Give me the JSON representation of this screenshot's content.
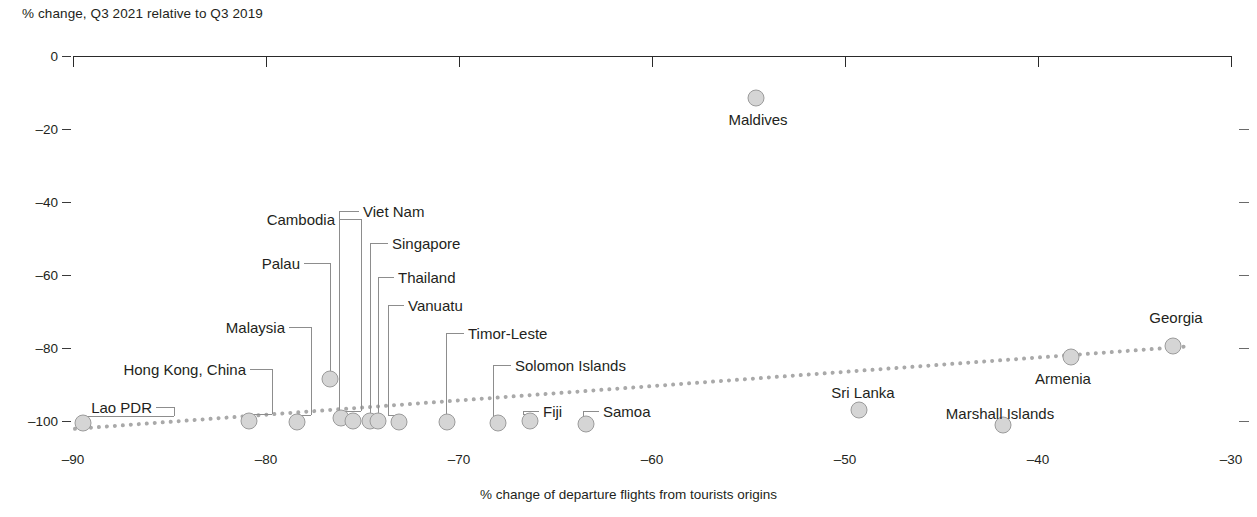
{
  "chart_data": {
    "type": "scatter",
    "title": "",
    "ylabel": "% change, Q3 2021 relative to Q3 2019",
    "xlabel": "% change of departure flights from tourists origins",
    "xlim": [
      -90,
      -30
    ],
    "ylim": [
      -105,
      0
    ],
    "xticks": [
      -90,
      -80,
      -70,
      -60,
      -50,
      -40,
      -30
    ],
    "xtick_labels": [
      "–90",
      "–80",
      "–70",
      "–60",
      "–50",
      "–40",
      "–30"
    ],
    "yticks": [
      0,
      -20,
      -40,
      -60,
      -80,
      -100
    ],
    "ytick_labels": [
      "0",
      "–20",
      "–40",
      "–60",
      "–80",
      "–100"
    ],
    "grid": false,
    "legend": "none",
    "points": [
      {
        "name": "Lao PDR",
        "x": -89.5,
        "y": -100.6
      },
      {
        "name": "Hong Kong, China",
        "x": -80.9,
        "y": -100.0
      },
      {
        "name": "Malaysia",
        "x": -78.4,
        "y": -100.3
      },
      {
        "name": "Palau",
        "x": -76.7,
        "y": -88.5
      },
      {
        "name": "Cambodia",
        "x": -76.1,
        "y": -99.2
      },
      {
        "name": "Viet Nam",
        "x": -75.5,
        "y": -99.9
      },
      {
        "name": "Singapore",
        "x": -74.6,
        "y": -100.1
      },
      {
        "name": "Thailand",
        "x": -74.2,
        "y": -100.1
      },
      {
        "name": "Vanuatu",
        "x": -73.1,
        "y": -100.3
      },
      {
        "name": "Timor-Leste",
        "x": -70.6,
        "y": -100.3
      },
      {
        "name": "Solomon Islands",
        "x": -68.0,
        "y": -100.5
      },
      {
        "name": "Fiji",
        "x": -66.3,
        "y": -100.0
      },
      {
        "name": "Samoa",
        "x": -63.4,
        "y": -100.7
      },
      {
        "name": "Maldives",
        "x": -54.6,
        "y": -11.5
      },
      {
        "name": "Sri Lanka",
        "x": -49.3,
        "y": -97.0
      },
      {
        "name": "Marshall Islands",
        "x": -41.8,
        "y": -101.2
      },
      {
        "name": "Armenia",
        "x": -38.3,
        "y": -82.5
      },
      {
        "name": "Georgia",
        "x": -33.0,
        "y": -79.4
      }
    ],
    "trendline": {
      "style": "dotted",
      "color": "#a9a9a9",
      "x_start": -90.0,
      "y_start": -101.6,
      "x_end": -32.3,
      "y_end": -79.0
    }
  },
  "colors": {
    "point_fill": "#d5d5d5",
    "point_stroke": "#9b9b9b",
    "axis": "#2a2a2a",
    "trend": "#a9a9a9",
    "text": "#231f20"
  }
}
